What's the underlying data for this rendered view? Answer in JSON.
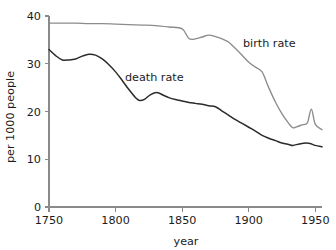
{
  "chart_data": {
    "type": "line",
    "title": "",
    "subtitle": "",
    "xlabel": "year",
    "ylabel": "per 1000 people",
    "xlim": [
      1750,
      1955
    ],
    "ylim": [
      0,
      40
    ],
    "grid": false,
    "legend_position": "inline-annotations",
    "xticks": [
      1750,
      1800,
      1850,
      1900,
      1950
    ],
    "xtick_labels": [
      "1750",
      "1800",
      "1850",
      "1900",
      "1950"
    ],
    "yticks": [
      0,
      10,
      20,
      30,
      40
    ],
    "ytick_labels": [
      "0",
      "10",
      "20",
      "30",
      "40"
    ],
    "annotations": [
      {
        "text": "birth rate",
        "x": 1905,
        "y": 33.0
      },
      {
        "text": "death rate",
        "x": 1818,
        "y": 27.5
      }
    ],
    "series": [
      {
        "name": "birth rate",
        "color": "#8c8c8c",
        "x": [
          1750,
          1760,
          1770,
          1780,
          1790,
          1800,
          1810,
          1820,
          1830,
          1840,
          1850,
          1855,
          1860,
          1865,
          1870,
          1875,
          1880,
          1885,
          1890,
          1895,
          1900,
          1905,
          1910,
          1915,
          1920,
          1925,
          1930,
          1933,
          1936,
          1940,
          1944,
          1947,
          1950,
          1955
        ],
        "y": [
          38.5,
          38.5,
          38.5,
          38.4,
          38.4,
          38.3,
          38.2,
          38.1,
          38.0,
          37.7,
          37.3,
          35.3,
          35.2,
          35.6,
          36.0,
          35.7,
          35.2,
          34.5,
          33.2,
          31.8,
          30.3,
          29.3,
          28.3,
          25.0,
          22.0,
          19.5,
          17.5,
          16.6,
          16.8,
          17.2,
          17.6,
          20.5,
          17.3,
          16.2
        ]
      },
      {
        "name": "death rate",
        "color": "#2b2b2b",
        "x": [
          1750,
          1755,
          1760,
          1765,
          1770,
          1775,
          1780,
          1785,
          1790,
          1795,
          1800,
          1805,
          1810,
          1815,
          1818,
          1822,
          1826,
          1831,
          1836,
          1840,
          1845,
          1850,
          1855,
          1860,
          1865,
          1870,
          1875,
          1880,
          1885,
          1890,
          1895,
          1900,
          1905,
          1910,
          1915,
          1920,
          1925,
          1930,
          1933,
          1938,
          1943,
          1946,
          1950,
          1955
        ],
        "y": [
          33.0,
          31.7,
          30.8,
          30.8,
          31.0,
          31.6,
          32.0,
          31.8,
          31.0,
          29.8,
          28.3,
          26.5,
          24.6,
          22.9,
          22.3,
          22.6,
          23.5,
          24.0,
          23.4,
          22.9,
          22.5,
          22.2,
          21.9,
          21.7,
          21.5,
          21.2,
          21.0,
          20.1,
          19.2,
          18.3,
          17.5,
          16.7,
          15.9,
          15.0,
          14.4,
          13.9,
          13.4,
          13.1,
          12.9,
          13.2,
          13.4,
          13.3,
          12.9,
          12.6
        ]
      }
    ]
  },
  "colors": {
    "background": "#ffffff",
    "axis": "#8a8a8a",
    "text": "#1c1c1c",
    "birth_rate": "#8c8c8c",
    "death_rate": "#2b2b2b"
  }
}
